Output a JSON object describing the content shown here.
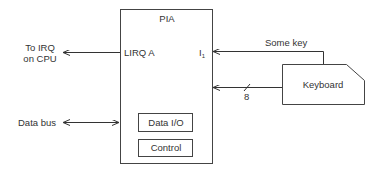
{
  "diagram": {
    "pia": {
      "title": "PIA",
      "pin_irq": "LIRQ A",
      "pin_input": "I",
      "pin_input_sub": "1",
      "blocks": [
        "Data I/O",
        "Control"
      ]
    },
    "cpu_irq": {
      "line1": "To IRQ",
      "line2": "on CPU"
    },
    "data_bus": {
      "label": "Data bus"
    },
    "keyboard": {
      "label": "Keyboard",
      "signal_label": "Some key",
      "bus_width": "8"
    }
  }
}
